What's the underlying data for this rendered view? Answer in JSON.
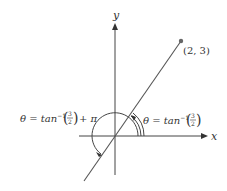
{
  "diagram": {
    "x_axis_label": "x",
    "y_axis_label": "y",
    "point_label": "(2, 3)",
    "angle_small": {
      "prefix": "θ = tan",
      "sup": "−1",
      "frac_num": "3",
      "frac_den": "2",
      "suffix": ""
    },
    "angle_large": {
      "prefix": "θ = tan",
      "sup": "−1",
      "frac_num": "3",
      "frac_den": "2",
      "suffix": "+ π"
    },
    "colors": {
      "axis": "#444444",
      "line": "#555555",
      "point": "#666666",
      "text": "#333333"
    }
  }
}
